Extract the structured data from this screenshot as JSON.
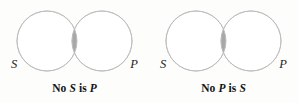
{
  "figure": {
    "type": "venn-diagram-pair",
    "background_color": "#fdfdfc",
    "circle_stroke_color": "#b9b9b9",
    "circle_fill_color": "#ffffff",
    "overlap_fill_color": "#a8a8a8",
    "text_color": "#141414"
  },
  "diagrams": [
    {
      "id": "no-s-is-p",
      "subject_label": "S",
      "predicate_label": "P",
      "caption": {
        "full_text": "No S is P",
        "prefix": "No",
        "first_term": "S",
        "copula": "is",
        "second_term": "P"
      },
      "shading": "overlap",
      "geometry": {
        "left_circle_center_x": 47,
        "right_circle_center_x": 102,
        "center_y": 41,
        "radius": 30
      }
    },
    {
      "id": "no-p-is-s",
      "subject_label": "S",
      "predicate_label": "P",
      "caption": {
        "full_text": "No P is S",
        "prefix": "No",
        "first_term": "P",
        "copula": "is",
        "second_term": "S"
      },
      "shading": "overlap",
      "geometry": {
        "left_circle_center_x": 47,
        "right_circle_center_x": 102,
        "center_y": 41,
        "radius": 30
      }
    }
  ]
}
